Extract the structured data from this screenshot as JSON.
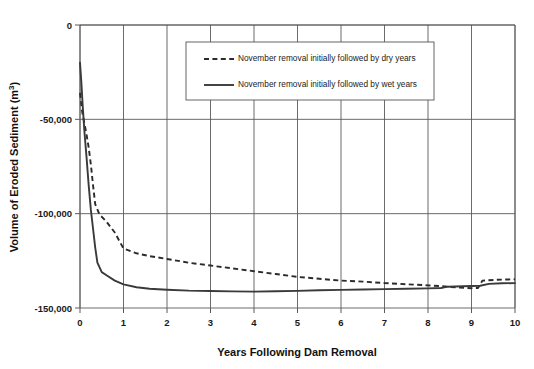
{
  "chart_data": {
    "type": "line",
    "title": "",
    "xlabel": "Years Following Dam Removal",
    "ylabel": "Volume of Eroded Sediment (m³)",
    "ylabel_base": "Volume of Eroded Sediment (m",
    "ylabel_sup": "3",
    "ylabel_close": ")",
    "xlim": [
      0,
      10
    ],
    "ylim": [
      -150000,
      0
    ],
    "grid": true,
    "legend_position": "top-center",
    "x_ticks": [
      "0",
      "1",
      "2",
      "3",
      "4",
      "5",
      "6",
      "7",
      "8",
      "9",
      "10"
    ],
    "x_tick_values": [
      0,
      1,
      2,
      3,
      4,
      5,
      6,
      7,
      8,
      9,
      10
    ],
    "y_ticks": [
      "0",
      "-50,000",
      "-100,000",
      "-150,000"
    ],
    "y_tick_values": [
      0,
      -50000,
      -100000,
      -150000
    ],
    "series": [
      {
        "name": "November removal initially followed by dry years",
        "style": "dashed",
        "color": "#2b2b2b",
        "x": [
          0.0,
          0.05,
          0.1,
          0.15,
          0.2,
          0.25,
          0.3,
          0.35,
          0.45,
          0.6,
          0.8,
          1.0,
          1.3,
          1.6,
          2.0,
          2.5,
          3.0,
          3.5,
          4.0,
          4.5,
          5.0,
          5.5,
          6.0,
          6.5,
          7.0,
          7.5,
          8.0,
          8.4,
          8.7,
          9.0,
          9.15,
          9.25,
          9.6,
          10.0
        ],
        "y": [
          -36000,
          -46000,
          -52000,
          -58000,
          -65000,
          -74000,
          -85000,
          -95000,
          -100500,
          -104000,
          -110000,
          -118500,
          -121000,
          -122500,
          -124000,
          -126000,
          -127500,
          -129000,
          -130500,
          -132000,
          -133500,
          -134500,
          -135500,
          -136000,
          -136800,
          -137400,
          -138000,
          -138600,
          -139200,
          -139500,
          -139400,
          -135500,
          -135000,
          -134800
        ]
      },
      {
        "name": "November removal initially followed by wet years",
        "style": "solid",
        "color": "#3a3a3a",
        "x": [
          0.0,
          0.03,
          0.06,
          0.1,
          0.15,
          0.2,
          0.25,
          0.3,
          0.35,
          0.4,
          0.5,
          0.6,
          0.8,
          1.0,
          1.3,
          1.6,
          2.0,
          2.5,
          3.0,
          3.5,
          4.0,
          4.5,
          5.0,
          5.5,
          6.0,
          6.5,
          7.0,
          7.5,
          8.0,
          8.3,
          8.45,
          8.8,
          9.0,
          9.2,
          9.4,
          9.7,
          10.0
        ],
        "y": [
          -20000,
          -30000,
          -42000,
          -56000,
          -70000,
          -85000,
          -98000,
          -108000,
          -118000,
          -126000,
          -131000,
          -132500,
          -135500,
          -137500,
          -139000,
          -139800,
          -140300,
          -140800,
          -141000,
          -141200,
          -141300,
          -141100,
          -140900,
          -140600,
          -140400,
          -140200,
          -140000,
          -139800,
          -139600,
          -139400,
          -138700,
          -138500,
          -138300,
          -138200,
          -137200,
          -136900,
          -136800
        ]
      }
    ]
  },
  "legend": {
    "entries": [
      {
        "label": "November removal initially followed by dry years",
        "style": "dashed"
      },
      {
        "label": "November removal initially followed by wet years",
        "style": "solid"
      }
    ]
  },
  "colors": {
    "dry_series": "#2b2b2b",
    "wet_series": "#3a3a3a",
    "grid": "#5a5a5a",
    "axis": "#6e6e6e",
    "background": "#ffffff"
  }
}
